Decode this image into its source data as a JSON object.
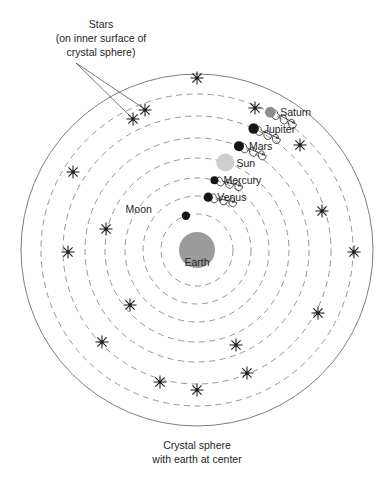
{
  "diagram": {
    "annotations": {
      "stars_label": {
        "line1": "Stars",
        "line2": "(on inner surface of",
        "line3": "crystal sphere)"
      },
      "caption": {
        "line1": "Crystal sphere",
        "line2": "with earth at center"
      }
    },
    "center_body": {
      "name": "Earth",
      "label": "Earth",
      "cx": 197,
      "cy": 250,
      "r": 18,
      "color": "#9b9b9b"
    },
    "geometry": {
      "center_x": 197,
      "center_y": 250,
      "crystal_sphere_radius": 176,
      "orbit_style": "dashed",
      "orbit_color": "#8a8a8a",
      "sphere_color": "#6f6f6f",
      "background": "#ffffff"
    },
    "orbits": [
      {
        "name": "Moon",
        "radius": 36,
        "label": "Moon",
        "label_dx": -34,
        "label_dy": -3,
        "label_anchor": "end",
        "body_r": 4.2,
        "body_color": "#161616",
        "angle_deg": 108,
        "epicycle": false
      },
      {
        "name": "Venus",
        "radius": 54,
        "label": "Venus",
        "label_dx": 9,
        "label_dy": 4,
        "label_anchor": "start",
        "body_r": 4.6,
        "body_color": "#161616",
        "angle_deg": 78,
        "epicycle": true
      },
      {
        "name": "Mercury",
        "radius": 72,
        "label": "Mercury",
        "label_dx": 9,
        "label_dy": 4,
        "label_anchor": "start",
        "body_r": 4.0,
        "body_color": "#161616",
        "angle_deg": 76,
        "epicycle": true
      },
      {
        "name": "Sun",
        "radius": 92,
        "label": "Sun",
        "label_dx": 11,
        "label_dy": 4,
        "label_anchor": "start",
        "body_r": 9.0,
        "body_color": "#cfcfcf",
        "angle_deg": 72,
        "epicycle": false
      },
      {
        "name": "Mars",
        "radius": 112,
        "label": "Mars",
        "label_dx": 10,
        "label_dy": 4,
        "label_anchor": "start",
        "body_r": 5.0,
        "body_color": "#161616",
        "angle_deg": 68,
        "epicycle": true
      },
      {
        "name": "Jupiter",
        "radius": 134,
        "label": "Jupiter",
        "label_dx": 10,
        "label_dy": 4,
        "label_anchor": "start",
        "body_r": 5.2,
        "body_color": "#161616",
        "angle_deg": 65,
        "epicycle": true
      },
      {
        "name": "Saturn",
        "radius": 156,
        "label": "Saturn",
        "label_dx": 10,
        "label_dy": 4,
        "label_anchor": "start",
        "body_r": 5.4,
        "body_color": "#8d8d8d",
        "angle_deg": 62,
        "epicycle": true
      }
    ],
    "stars": [
      {
        "x": 197,
        "y": 78
      },
      {
        "x": 145,
        "y": 110
      },
      {
        "x": 133,
        "y": 119
      },
      {
        "x": 255,
        "y": 108
      },
      {
        "x": 300,
        "y": 145
      },
      {
        "x": 73,
        "y": 172
      },
      {
        "x": 322,
        "y": 211
      },
      {
        "x": 106,
        "y": 229
      },
      {
        "x": 354,
        "y": 252
      },
      {
        "x": 68,
        "y": 252
      },
      {
        "x": 130,
        "y": 305
      },
      {
        "x": 318,
        "y": 313
      },
      {
        "x": 102,
        "y": 342
      },
      {
        "x": 236,
        "y": 345
      },
      {
        "x": 247,
        "y": 373
      },
      {
        "x": 197,
        "y": 390
      },
      {
        "x": 160,
        "y": 382
      }
    ],
    "star_label_anchor": {
      "x": 76,
      "y": 63
    },
    "star_leader_targets": [
      {
        "x": 143,
        "y": 108
      },
      {
        "x": 131,
        "y": 117
      }
    ],
    "stars_label_pos": {
      "x": 101,
      "y": 28
    },
    "caption_pos": {
      "x": 197,
      "y": 449
    }
  }
}
